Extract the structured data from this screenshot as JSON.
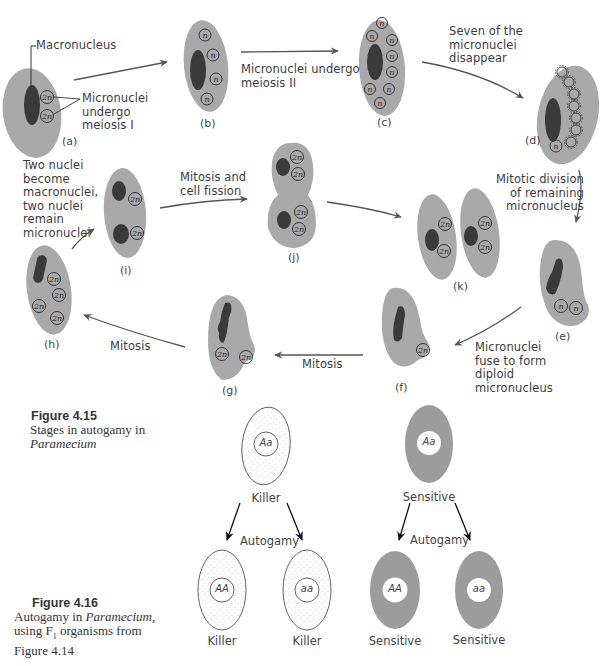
{
  "figure_4_15": {
    "number": "Figure 4.15",
    "caption_line1": "Stages in autogamy in",
    "caption_line2": "Paramecium",
    "labels": {
      "macronucleus": "Macronucleus",
      "step_a": "Micronuclei\nundergo\nmeiosis I",
      "step_b": "Micronuclei undergo\nmeiosis II",
      "step_c": "Seven of the\nmicronuclei\ndisappear",
      "step_d": "Mitotic division\nof remaining\nmicronucleus",
      "step_e": "Micronuclei\nfuse to form\ndiploid\nmicronucleus",
      "step_f": "Mitosis",
      "step_g": "Mitosis",
      "step_h": "Two nuclei\nbecome\nmacronuclei,\ntwo nuclei\nremain\nmicronuclei",
      "step_i": "Mitosis and\ncell fission"
    },
    "stages": [
      "(a)",
      "(b)",
      "(c)",
      "(d)",
      "(e)",
      "(f)",
      "(g)",
      "(h)",
      "(i)",
      "(j)",
      "(k)"
    ],
    "ploidy": {
      "diploid": "2n",
      "haploid": "n"
    }
  },
  "figure_4_16": {
    "number": "Figure 4.16",
    "caption_line1_a": "Autogamy in ",
    "caption_line1_b": "Paramecium,",
    "caption_line2_a": "using F",
    "caption_line2_sub": "1",
    "caption_line2_b": " organisms from",
    "caption_line3": "Figure 4.14",
    "process_label": "Autogamy",
    "parents": [
      {
        "genotype": "Aa",
        "phenotype": "Killer"
      },
      {
        "genotype": "Aa",
        "phenotype": "Sensitive"
      }
    ],
    "offspring": [
      {
        "genotype": "AA",
        "phenotype": "Killer"
      },
      {
        "genotype": "aa",
        "phenotype": "Killer"
      },
      {
        "genotype": "AA",
        "phenotype": "Sensitive"
      },
      {
        "genotype": "aa",
        "phenotype": "Sensitive"
      }
    ]
  },
  "colors": {
    "cell": "#a9a9a9",
    "macronucleus": "#3a3a3a",
    "arrow": "#555555",
    "stipple": "#b8b8b8"
  }
}
